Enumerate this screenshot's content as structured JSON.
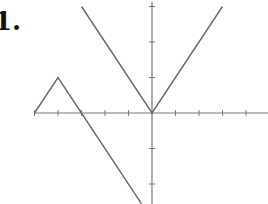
{
  "problem": {
    "label": "1."
  },
  "chart_data": {
    "type": "line",
    "title": "",
    "xlabel": "",
    "ylabel": "",
    "xlim": [
      -5,
      5
    ],
    "ylim": [
      -2.5,
      3
    ],
    "x_ticks": [
      -5,
      -4,
      -3,
      -2,
      -1,
      1,
      2,
      3,
      4
    ],
    "y_ticks": [
      -2,
      -1,
      1,
      2,
      3
    ],
    "grid": false,
    "series": [
      {
        "name": "piece-left",
        "points": [
          [
            -5,
            0
          ],
          [
            -4,
            1
          ],
          [
            -0.45,
            -2.55
          ]
        ]
      },
      {
        "name": "piece-right-v",
        "points": [
          [
            -3,
            3
          ],
          [
            0,
            0
          ],
          [
            3,
            3
          ]
        ]
      }
    ],
    "colors": {
      "axis": "#777777",
      "curve": "#666666",
      "text": "#111111"
    }
  }
}
